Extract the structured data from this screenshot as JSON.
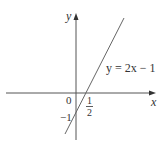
{
  "figure": {
    "type": "graph-of-linear-function",
    "equation_label": "y = 2x − 1",
    "axes": {
      "x_label": "x",
      "y_label": "y"
    },
    "tick_labels": {
      "origin": "0",
      "y_intercept": "−1",
      "x_intercept_numerator": "1",
      "x_intercept_denominator": "2"
    },
    "colors": {
      "axes": "#555555",
      "line": "#666666",
      "text": "#333333"
    }
  }
}
